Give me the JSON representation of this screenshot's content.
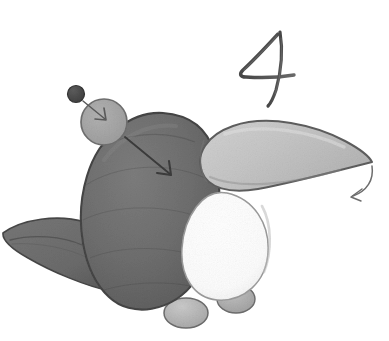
{
  "canvas": {
    "width": 389,
    "height": 341,
    "background_color": "#ffffff",
    "medium": "pencil-sketch",
    "title": "Hand-drawn penguin sketch with annotation arrows"
  },
  "annotations": {
    "numeral": {
      "text": "4",
      "style": "handwritten-script",
      "color": "#4f4f4f",
      "x": 232,
      "y": 24
    },
    "arrows": [
      {
        "name": "arrow-dot-to-circle",
        "description": "short straight arrow from small dark dot into medium gray circle",
        "from_x": 82,
        "from_y": 92,
        "to_x": 106,
        "to_y": 117,
        "color": "#5a5a5a"
      },
      {
        "name": "arrow-circle-to-body",
        "description": "long straight arrow from medium gray circle into dark body",
        "from_x": 128,
        "from_y": 139,
        "to_x": 170,
        "to_y": 174,
        "color": "#3c3c3c"
      },
      {
        "name": "arrow-beak-tip",
        "description": "curved arrow from beak tip pointing down-left",
        "from_x": 372,
        "from_y": 163,
        "to_x": 349,
        "to_y": 196,
        "color": "#6a6a6a"
      }
    ]
  },
  "shapes": {
    "body": {
      "name": "penguin-body",
      "fill_color": "#6e6e6e",
      "stroke_color": "#4a4a4a",
      "center_x": 161,
      "center_y": 211,
      "radius_x": 64,
      "radius_y": 98
    },
    "belly": {
      "name": "penguin-belly",
      "fill_color": "#fdfdfd",
      "stroke_color": "#9a9a9a",
      "center_x": 225,
      "center_y": 247,
      "radius_x": 42,
      "radius_y": 54
    },
    "beak": {
      "name": "penguin-beak",
      "fill_color": "#c6c6c6",
      "stroke_color": "#5e5e5e",
      "tip_x": 372,
      "tip_y": 162,
      "base_x": 205,
      "base_y": 155
    },
    "tail": {
      "name": "penguin-tail-flipper",
      "fill_color": "#6b6b6b",
      "stroke_color": "#474747",
      "tip_x": 2,
      "tip_y": 236,
      "base_x": 118,
      "base_y": 285
    },
    "feet": [
      {
        "name": "penguin-foot-left",
        "fill_color": "#b8b8b8",
        "stroke_color": "#6d6d6d",
        "center_x": 185,
        "center_y": 312,
        "radius_x": 21,
        "radius_y": 15
      },
      {
        "name": "penguin-foot-right",
        "fill_color": "#b0b0b0",
        "stroke_color": "#6d6d6d",
        "center_x": 236,
        "center_y": 299,
        "radius_x": 18,
        "radius_y": 13
      }
    ],
    "callout_circle": {
      "name": "callout-circle",
      "fill_color": "#a6a6a6",
      "stroke_color": "#707070",
      "center_x": 104,
      "center_y": 122,
      "radius": 23
    },
    "callout_dot": {
      "name": "callout-dot",
      "fill_color": "#4a4a4a",
      "stroke_color": "#3a3a3a",
      "center_x": 76,
      "center_y": 94,
      "radius": 8
    }
  },
  "palette": {
    "background": "#ffffff",
    "body_fill": "#6e6e6e",
    "body_stroke": "#4a4a4a",
    "beak_fill": "#c6c6c6",
    "belly_fill": "#fdfdfd",
    "foot_fill": "#b8b8b8",
    "circle_fill": "#a6a6a6",
    "dot_fill": "#4a4a4a",
    "pencil_dark": "#3c3c3c"
  }
}
